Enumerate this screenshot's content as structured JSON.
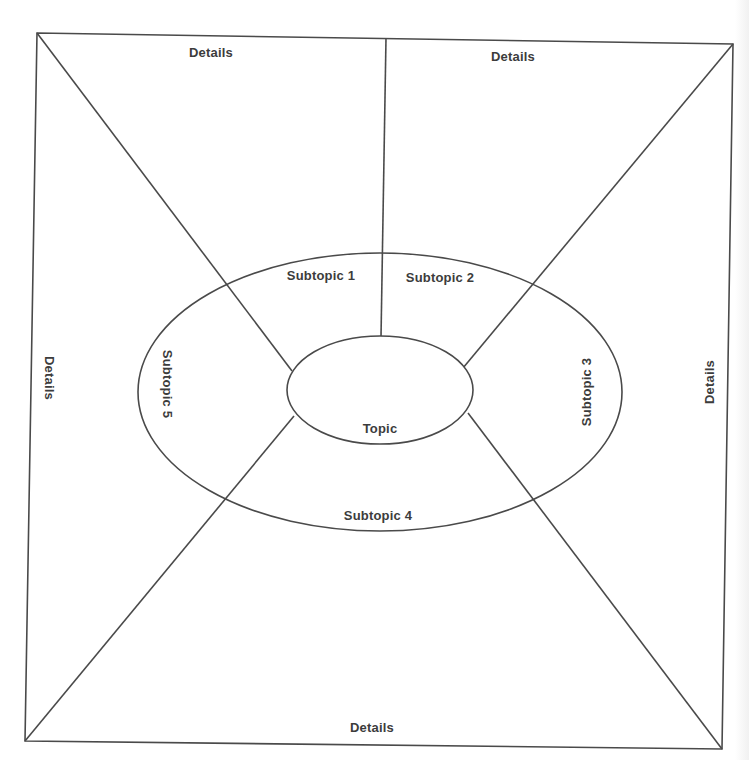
{
  "diagram": {
    "type": "topic-web graphic organizer",
    "stroke_color": "#4a4a4a",
    "text_color": "#3c3c3c",
    "center": {
      "label": "Topic"
    },
    "subtopics": [
      {
        "id": 1,
        "label": "Subtopic 1"
      },
      {
        "id": 2,
        "label": "Subtopic 2"
      },
      {
        "id": 3,
        "label": "Subtopic 3"
      },
      {
        "id": 4,
        "label": "Subtopic 4"
      },
      {
        "id": 5,
        "label": "Subtopic 5"
      }
    ],
    "details": {
      "top_left": "Details",
      "top_right": "Details",
      "right": "Details",
      "bottom": "Details",
      "left": "Details"
    }
  }
}
